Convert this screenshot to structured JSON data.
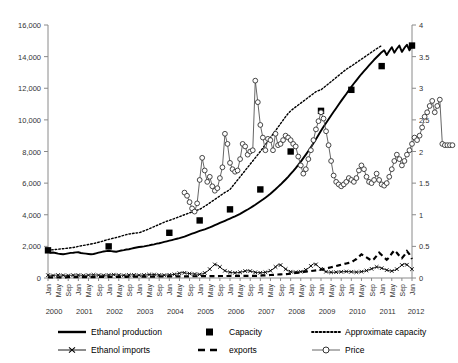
{
  "chart_data": {
    "type": "line",
    "title": "",
    "xlabel": "",
    "ylabel_left": "",
    "ylabel_right": "",
    "grid": false,
    "legend_position": "bottom",
    "ylim_left": [
      0,
      16000
    ],
    "ylim_right": [
      0,
      4
    ],
    "ytick_labels_left": [
      "0",
      "2,000",
      "4,000",
      "6,000",
      "8,000",
      "10,000",
      "12,000",
      "14,000",
      "16,000"
    ],
    "ytick_values_left": [
      0,
      2000,
      4000,
      6000,
      8000,
      10000,
      12000,
      14000,
      16000
    ],
    "ytick_labels_right": [
      "0",
      "0.5",
      "1",
      "1.5",
      "2",
      "2.5",
      "3",
      "3.5",
      "4"
    ],
    "ytick_values_right": [
      0,
      0.5,
      1,
      1.5,
      2,
      2.5,
      3,
      3.5,
      4
    ],
    "xtick_month_labels": [
      "Jan",
      "May",
      "Sep"
    ],
    "xtick_year_labels": [
      "2000",
      "2001",
      "2002",
      "2003",
      "2004",
      "2005",
      "2006",
      "2007",
      "2008",
      "2009",
      "2010",
      "2011",
      "2012"
    ],
    "x_start": "Jan 2000",
    "x_end": "Jan 2012",
    "series": [
      {
        "name": "Ethanol production",
        "axis": "left",
        "style": "solid-line",
        "values": [
          1660,
          1600,
          1610,
          1580,
          1540,
          1520,
          1500,
          1530,
          1560,
          1590,
          1600,
          1620,
          1630,
          1580,
          1560,
          1540,
          1520,
          1500,
          1520,
          1560,
          1600,
          1640,
          1680,
          1700,
          1720,
          1700,
          1680,
          1660,
          1700,
          1740,
          1760,
          1800,
          1820,
          1860,
          1900,
          1930,
          1960,
          1980,
          2000,
          2030,
          2060,
          2100,
          2130,
          2170,
          2200,
          2240,
          2280,
          2320,
          2360,
          2400,
          2440,
          2480,
          2520,
          2570,
          2620,
          2680,
          2740,
          2800,
          2860,
          2920,
          2980,
          3030,
          3080,
          3140,
          3200,
          3270,
          3340,
          3410,
          3480,
          3550,
          3620,
          3690,
          3760,
          3830,
          3900,
          3980,
          4060,
          4150,
          4240,
          4330,
          4430,
          4530,
          4630,
          4740,
          4850,
          4960,
          5080,
          5200,
          5330,
          5470,
          5610,
          5760,
          5910,
          6070,
          6230,
          6400,
          6580,
          6760,
          6950,
          7150,
          7360,
          7580,
          7800,
          8030,
          8270,
          8520,
          8780,
          9040,
          9310,
          9560,
          9800,
          10040,
          10280,
          10510,
          10740,
          10970,
          11200,
          11420,
          11640,
          11870,
          12090,
          12300,
          12500,
          12700,
          12900,
          13080,
          13260,
          13440,
          13620,
          13800,
          13960,
          14120,
          14280,
          14400,
          14100,
          14350,
          14600,
          14250,
          14500,
          14700,
          14300,
          14550,
          14750,
          14400,
          14700
        ],
        "end_value": 14700,
        "start_value": 1660
      },
      {
        "name": "Capacity",
        "axis": "left",
        "style": "filled-square-markers",
        "points": [
          {
            "x": "Jan 2000",
            "y": 1750
          },
          {
            "x": "Jan 2002",
            "y": 2000
          },
          {
            "x": "Jan 2004",
            "y": 2860
          },
          {
            "x": "Jan 2005",
            "y": 3640
          },
          {
            "x": "Jan 2006",
            "y": 4340
          },
          {
            "x": "Jan 2007",
            "y": 5600
          },
          {
            "x": "Jan 2008",
            "y": 8000
          },
          {
            "x": "Jan 2009",
            "y": 10570
          },
          {
            "x": "Jan 2010",
            "y": 11900
          },
          {
            "x": "Jan 2011",
            "y": 13400
          },
          {
            "x": "Jan 2012",
            "y": 14700
          }
        ]
      },
      {
        "name": "Approximate capacity",
        "axis": "left",
        "style": "dotted-line",
        "values": [
          1750,
          1770,
          1790,
          1800,
          1820,
          1840,
          1850,
          1870,
          1890,
          1910,
          1930,
          1960,
          2000,
          2030,
          2060,
          2090,
          2120,
          2150,
          2180,
          2220,
          2260,
          2300,
          2350,
          2400,
          2440,
          2480,
          2520,
          2560,
          2600,
          2650,
          2700,
          2740,
          2780,
          2800,
          2830,
          2850,
          2860,
          2920,
          2980,
          3040,
          3110,
          3180,
          3250,
          3320,
          3390,
          3460,
          3530,
          3590,
          3640,
          3700,
          3760,
          3820,
          3880,
          3940,
          4000,
          4060,
          4120,
          4180,
          4240,
          4290,
          4340,
          4440,
          4540,
          4640,
          4750,
          4860,
          4970,
          5080,
          5190,
          5300,
          5410,
          5500,
          5600,
          5800,
          6000,
          6200,
          6400,
          6600,
          6800,
          7000,
          7200,
          7400,
          7600,
          7800,
          8000,
          8220,
          8440,
          8660,
          8880,
          9100,
          9320,
          9540,
          9760,
          9980,
          10200,
          10400,
          10570,
          10700,
          10820,
          10940,
          11060,
          11180,
          11300,
          11420,
          11540,
          11660,
          11780,
          11850,
          11900,
          12030,
          12160,
          12290,
          12420,
          12550,
          12680,
          12810,
          12940,
          13070,
          13200,
          13300,
          13400,
          13510,
          13620,
          13730,
          13840,
          13950,
          14060,
          14170,
          14280,
          14390,
          14500,
          14600,
          14700
        ],
        "end_value": 14700,
        "start_value": 1750
      },
      {
        "name": "Ethanol imports",
        "axis": "left",
        "style": "x-markers-line",
        "values": [
          180,
          170,
          160,
          175,
          185,
          190,
          170,
          165,
          160,
          170,
          180,
          190,
          185,
          175,
          165,
          170,
          180,
          195,
          200,
          190,
          180,
          175,
          170,
          180,
          190,
          200,
          210,
          195,
          185,
          175,
          170,
          180,
          190,
          200,
          195,
          185,
          175,
          180,
          190,
          200,
          215,
          230,
          220,
          200,
          190,
          185,
          180,
          190,
          200,
          210,
          230,
          260,
          300,
          340,
          330,
          300,
          280,
          260,
          250,
          240,
          230,
          260,
          320,
          420,
          560,
          720,
          860,
          820,
          700,
          560,
          460,
          400,
          360,
          340,
          330,
          340,
          360,
          400,
          440,
          460,
          440,
          400,
          360,
          340,
          330,
          340,
          360,
          400,
          460,
          560,
          700,
          840,
          820,
          700,
          560,
          460,
          400,
          380,
          370,
          380,
          400,
          450,
          520,
          620,
          760,
          900,
          860,
          720,
          580,
          470,
          400,
          370,
          360,
          360,
          370,
          380,
          390,
          400,
          410,
          400,
          390,
          380,
          370,
          380,
          400,
          430,
          470,
          520,
          580,
          640,
          700,
          680,
          620,
          560,
          500,
          460,
          440,
          480,
          560,
          680,
          820,
          900,
          840,
          700,
          560
        ],
        "peak_value": 900
      },
      {
        "name": "exports",
        "axis": "left",
        "style": "dashed-line",
        "values": [
          40,
          40,
          40,
          40,
          45,
          45,
          45,
          45,
          50,
          50,
          50,
          50,
          55,
          55,
          55,
          55,
          60,
          60,
          60,
          60,
          65,
          65,
          65,
          65,
          70,
          70,
          70,
          70,
          75,
          75,
          75,
          75,
          80,
          80,
          80,
          80,
          85,
          85,
          85,
          85,
          90,
          90,
          90,
          90,
          95,
          95,
          95,
          95,
          100,
          100,
          100,
          100,
          105,
          105,
          105,
          105,
          110,
          110,
          110,
          110,
          115,
          115,
          115,
          115,
          120,
          120,
          120,
          120,
          125,
          125,
          125,
          125,
          130,
          130,
          130,
          130,
          135,
          135,
          135,
          135,
          140,
          140,
          140,
          140,
          150,
          160,
          170,
          180,
          190,
          200,
          210,
          220,
          230,
          240,
          250,
          260,
          280,
          300,
          320,
          340,
          360,
          380,
          400,
          420,
          440,
          460,
          480,
          500,
          520,
          560,
          600,
          640,
          680,
          720,
          760,
          800,
          840,
          880,
          920,
          960,
          1000,
          1100,
          1200,
          1350,
          1500,
          1400,
          1300,
          1200,
          1100,
          1200,
          1400,
          1600,
          1450,
          1300,
          1150,
          1300,
          1550,
          1750,
          1600,
          1400,
          1250,
          1450,
          1700,
          1500,
          1200
        ],
        "peak_value": 1750
      },
      {
        "name": "Price",
        "axis": "right",
        "style": "open-circle-markers-line",
        "start_index": 54,
        "values": [
          1.35,
          1.3,
          1.2,
          1.1,
          1.05,
          1.18,
          1.55,
          1.9,
          1.7,
          1.52,
          1.6,
          1.45,
          1.38,
          1.42,
          1.58,
          1.75,
          2.28,
          2.12,
          1.82,
          1.72,
          1.68,
          1.7,
          1.88,
          2.12,
          2.08,
          1.95,
          2.0,
          2.02,
          3.12,
          2.78,
          2.42,
          2.22,
          2.02,
          2.2,
          2.18,
          2.02,
          2.28,
          2.1,
          2.12,
          2.18,
          2.25,
          2.22,
          2.18,
          2.12,
          2.08,
          1.92,
          1.78,
          1.65,
          1.72,
          1.88,
          2.02,
          2.18,
          2.35,
          2.48,
          2.62,
          2.52,
          2.32,
          2.1,
          1.85,
          1.62,
          1.52,
          1.48,
          1.45,
          1.48,
          1.52,
          1.58,
          1.55,
          1.52,
          1.58,
          1.7,
          1.78,
          1.72,
          1.6,
          1.52,
          1.5,
          1.55,
          1.65,
          1.55,
          1.48,
          1.46,
          1.5,
          1.6,
          1.72,
          1.85,
          1.95,
          1.88,
          1.78,
          1.85,
          1.95,
          2.02,
          2.12,
          2.22,
          2.18,
          2.25,
          2.38,
          2.55,
          2.62,
          2.72,
          2.8,
          2.62,
          2.72,
          2.82,
          2.12,
          2.1,
          2.1,
          2.1,
          2.1
        ],
        "peak_value": 2.82,
        "end_value": 2.1
      }
    ],
    "legend": [
      {
        "label": "Ethanol production",
        "marker": "solid-line"
      },
      {
        "label": "Capacity",
        "marker": "filled-square"
      },
      {
        "label": "Approximate capacity",
        "marker": "dotted-line"
      },
      {
        "label": "Ethanol imports",
        "marker": "x-marker-line"
      },
      {
        "label": "exports",
        "marker": "dashed-line"
      },
      {
        "label": "Price",
        "marker": "open-circle-line"
      }
    ]
  }
}
